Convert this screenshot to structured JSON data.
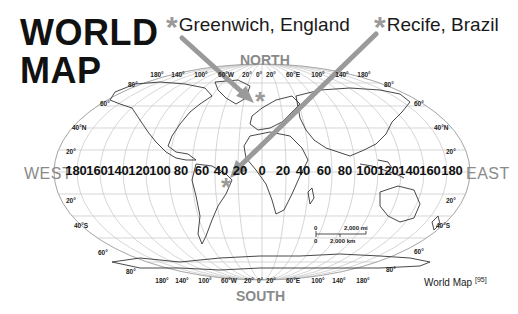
{
  "title": {
    "line1": "WORLD",
    "line2": "MAP"
  },
  "callouts": [
    {
      "label": "Greenwich, England",
      "marker": "*",
      "marker_color": "#999999"
    },
    {
      "label": "Recife, Brazil",
      "marker": "*",
      "marker_color": "#999999"
    }
  ],
  "directions": {
    "north": "NORTH",
    "south": "SOUTH",
    "west": "WEST",
    "east": "EAST"
  },
  "longitude_axis": [
    "180",
    "160",
    "140",
    "120",
    "100",
    "80",
    "60",
    "40",
    "20",
    "0",
    "20",
    "40",
    "60",
    "80",
    "100",
    "120",
    "140",
    "160",
    "180"
  ],
  "meridian_labels_top": [
    "180°",
    "140°",
    "100°",
    "60°W",
    "20°",
    "0°",
    "20°",
    "60°E",
    "100°",
    "140°",
    "180°"
  ],
  "meridian_labels_bottom": [
    "180°",
    "140°",
    "100°",
    "60°W",
    "20°",
    "0°",
    "20°",
    "60°E",
    "100°",
    "140°",
    "180°"
  ],
  "latitude_labels_left": [
    "80°",
    "60°",
    "40°N",
    "20°",
    "20°",
    "40°S",
    "60°",
    "80°"
  ],
  "latitude_labels_right": [
    "80°",
    "60°",
    "40°N",
    "20°",
    "20°",
    "40°S",
    "60°",
    "80°"
  ],
  "scale_bar": {
    "zero_top": "0",
    "miles": "2,000 mi",
    "zero_bottom": "0",
    "km": "2,000 km"
  },
  "credit": {
    "text": "World Map",
    "ref": "[95]"
  },
  "colors": {
    "arrow": "#9a9a9a",
    "star": "#999999",
    "direction_text": "#8a8a8a",
    "grid": "#bdbdbd",
    "coast": "#333333"
  }
}
